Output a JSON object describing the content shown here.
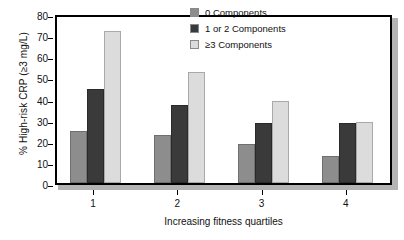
{
  "chart_data": {
    "type": "bar",
    "title": "",
    "xlabel": "Increasing fitness quartiles",
    "ylabel": "% High-risk CRP (≥3 mg/L)",
    "categories": [
      "1",
      "2",
      "3",
      "4"
    ],
    "ylim": [
      0,
      80
    ],
    "yticks": [
      "80",
      "70",
      "60",
      "50",
      "40",
      "30",
      "20",
      "10",
      "0"
    ],
    "ytick_values": [
      80,
      70,
      60,
      50,
      40,
      30,
      20,
      10,
      0
    ],
    "grid": false,
    "legend_position": "top-right-inside",
    "series": [
      {
        "name": "0 Components",
        "color": "#8d8d8d",
        "values": [
          24.5,
          22.7,
          18.5,
          13.0
        ]
      },
      {
        "name": "1 or 2 Components",
        "color": "#3a3a3a",
        "values": [
          44.5,
          36.8,
          28.4,
          28.3
        ]
      },
      {
        "name": "≥3 Components",
        "color": "#dcdcdc",
        "values": [
          72.0,
          52.6,
          39.0,
          29.0
        ]
      }
    ]
  }
}
